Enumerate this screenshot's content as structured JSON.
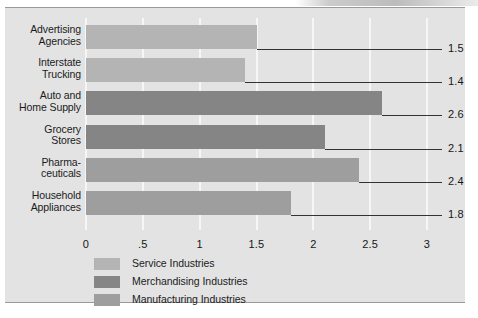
{
  "chart_data": {
    "type": "bar",
    "orientation": "horizontal",
    "title": "",
    "subtitle": "",
    "xlabel": "",
    "ylabel": "",
    "xlim": [
      0,
      3
    ],
    "grid": true,
    "gridlines_at": [
      0,
      0.5,
      1,
      1.5,
      2,
      2.5,
      3
    ],
    "xtick_labels": [
      "0",
      ".5",
      "1",
      "1.5",
      "2",
      "2.5",
      "3"
    ],
    "xtick_values": [
      0,
      0.5,
      1,
      1.5,
      2,
      2.5,
      3
    ],
    "legend_position": "bottom-left",
    "categories": [
      "Advertising Agencies",
      "Interstate Trucking",
      "Auto and Home Supply",
      "Grocery Stores",
      "Pharmaceuticals",
      "Household Appliances"
    ],
    "values": [
      1.5,
      1.4,
      2.6,
      2.1,
      2.4,
      1.8
    ],
    "value_labels": [
      "1.5",
      "1.4",
      "2.6",
      "2.1",
      "2.4",
      "1.8"
    ],
    "bars": [
      {
        "label_line1": "Advertising",
        "label_line2": "Agencies",
        "value": 1.5,
        "value_label": "1.5",
        "group": "Service Industries",
        "color": "#b4b4b4",
        "color_class": "c-service"
      },
      {
        "label_line1": "Interstate",
        "label_line2": "Trucking",
        "value": 1.4,
        "value_label": "1.4",
        "group": "Service Industries",
        "color": "#b4b4b4",
        "color_class": "c-service"
      },
      {
        "label_line1": "Auto and",
        "label_line2": "Home Supply",
        "value": 2.6,
        "value_label": "2.6",
        "group": "Merchandising Industries",
        "color": "#858585",
        "color_class": "c-merch"
      },
      {
        "label_line1": "Grocery",
        "label_line2": "Stores",
        "value": 2.1,
        "value_label": "2.1",
        "group": "Merchandising Industries",
        "color": "#858585",
        "color_class": "c-merch"
      },
      {
        "label_line1": "Pharma-",
        "label_line2": "ceuticals",
        "value": 2.4,
        "value_label": "2.4",
        "group": "Manufacturing Industries",
        "color": "#9e9e9e",
        "color_class": "c-manufacturing"
      },
      {
        "label_line1": "Household",
        "label_line2": "Appliances",
        "value": 1.8,
        "value_label": "1.8",
        "group": "Manufacturing Industries",
        "color": "#9e9e9e",
        "color_class": "c-manufacturing"
      }
    ],
    "legend": [
      {
        "label": "Service Industries",
        "color": "#b4b4b4",
        "color_class": "c-service"
      },
      {
        "label": "Merchandising Industries",
        "color": "#858585",
        "color_class": "c-merch"
      },
      {
        "label": "Manufacturing Industries",
        "color": "#9e9e9e",
        "color_class": "c-manufacturing"
      }
    ]
  },
  "colors": {
    "page_background": "#ffffff",
    "panel_background": "#e3e3e3",
    "panel_border": "#9a9a9a",
    "gridline": "#f6f6f6",
    "leader_line": "#333333",
    "text": "#1b1b1b"
  }
}
